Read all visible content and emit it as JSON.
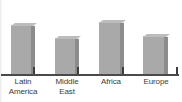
{
  "chart_data": {
    "type": "bar",
    "title": "",
    "subtitle": "",
    "xlabel": "",
    "ylabel": "",
    "grid": false,
    "legend": false,
    "axis_baseline_color": "#4a4a4a",
    "bar_face_color": "#a9a9a9",
    "bar_side_color": "#8c8c8c",
    "bar_top_color": "#bcbcbc",
    "ylim": [
      0,
      60
    ],
    "categories": [
      "Latin America",
      "Middle East",
      "Africa",
      "Europe"
    ],
    "category_lines": [
      [
        "Latin",
        "America"
      ],
      [
        "Middle",
        "East"
      ],
      [
        "Africa"
      ],
      [
        "Europe"
      ]
    ],
    "values": [
      48,
      35,
      51,
      37
    ],
    "bars": [
      {
        "label": "Latin America",
        "value": 48,
        "x": 11,
        "width": 20
      },
      {
        "label": "Middle East",
        "value": 35,
        "x": 55,
        "width": 20
      },
      {
        "label": "Africa",
        "value": 51,
        "x": 99,
        "width": 21
      },
      {
        "label": "Europe",
        "value": 37,
        "x": 143,
        "width": 21
      }
    ],
    "ticks": [
      {
        "x": 33
      },
      {
        "x": 77
      },
      {
        "x": 122
      },
      {
        "x": 176
      }
    ],
    "label_positions": [
      {
        "left": 0,
        "width": 46
      },
      {
        "left": 44,
        "width": 46
      },
      {
        "left": 88,
        "width": 46
      },
      {
        "left": 132,
        "width": 48
      }
    ]
  }
}
